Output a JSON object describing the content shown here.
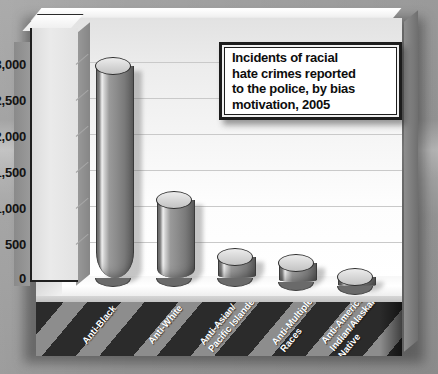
{
  "chart_data": {
    "type": "bar",
    "title_lines": [
      "Incidents of racial",
      "hate crimes reported",
      "to the police, by bias",
      "motivation, 2005"
    ],
    "categories": [
      "Anti-Black",
      "Anti-White",
      "Anti-Asian/\nPacific Islander",
      "Anti-Multiple\nRaces",
      "Anti-American\nIndian/Alaskan\nNative"
    ],
    "values": [
      2700,
      950,
      200,
      200,
      100
    ],
    "xlabel": "",
    "ylabel": "",
    "ylim": [
      0,
      3000
    ],
    "yticks": [
      0,
      500,
      1000,
      1500,
      2000,
      2500,
      3000
    ],
    "ytick_labels": [
      "0",
      "500",
      "1,000",
      "1,500",
      "2,000",
      "2,500",
      "3,000"
    ],
    "grid": true,
    "legend": false,
    "style": "3d-cylinder",
    "colors": {
      "bar": "#8b8b8b",
      "bar_highlight": "#f0f0f0",
      "bar_edge": "#3a3a3a",
      "wall": "#f6f6f6",
      "gridline": "#c9c9c9",
      "axis_face": "#e2e2e2",
      "label_band_dark": "#2b2b2b",
      "label_band_light": "#8d8d8d",
      "label_text": "#ffffff",
      "title_border": "#1c1c1c",
      "title_bg": "#ffffff",
      "page_background": "#9d9d9d"
    }
  }
}
